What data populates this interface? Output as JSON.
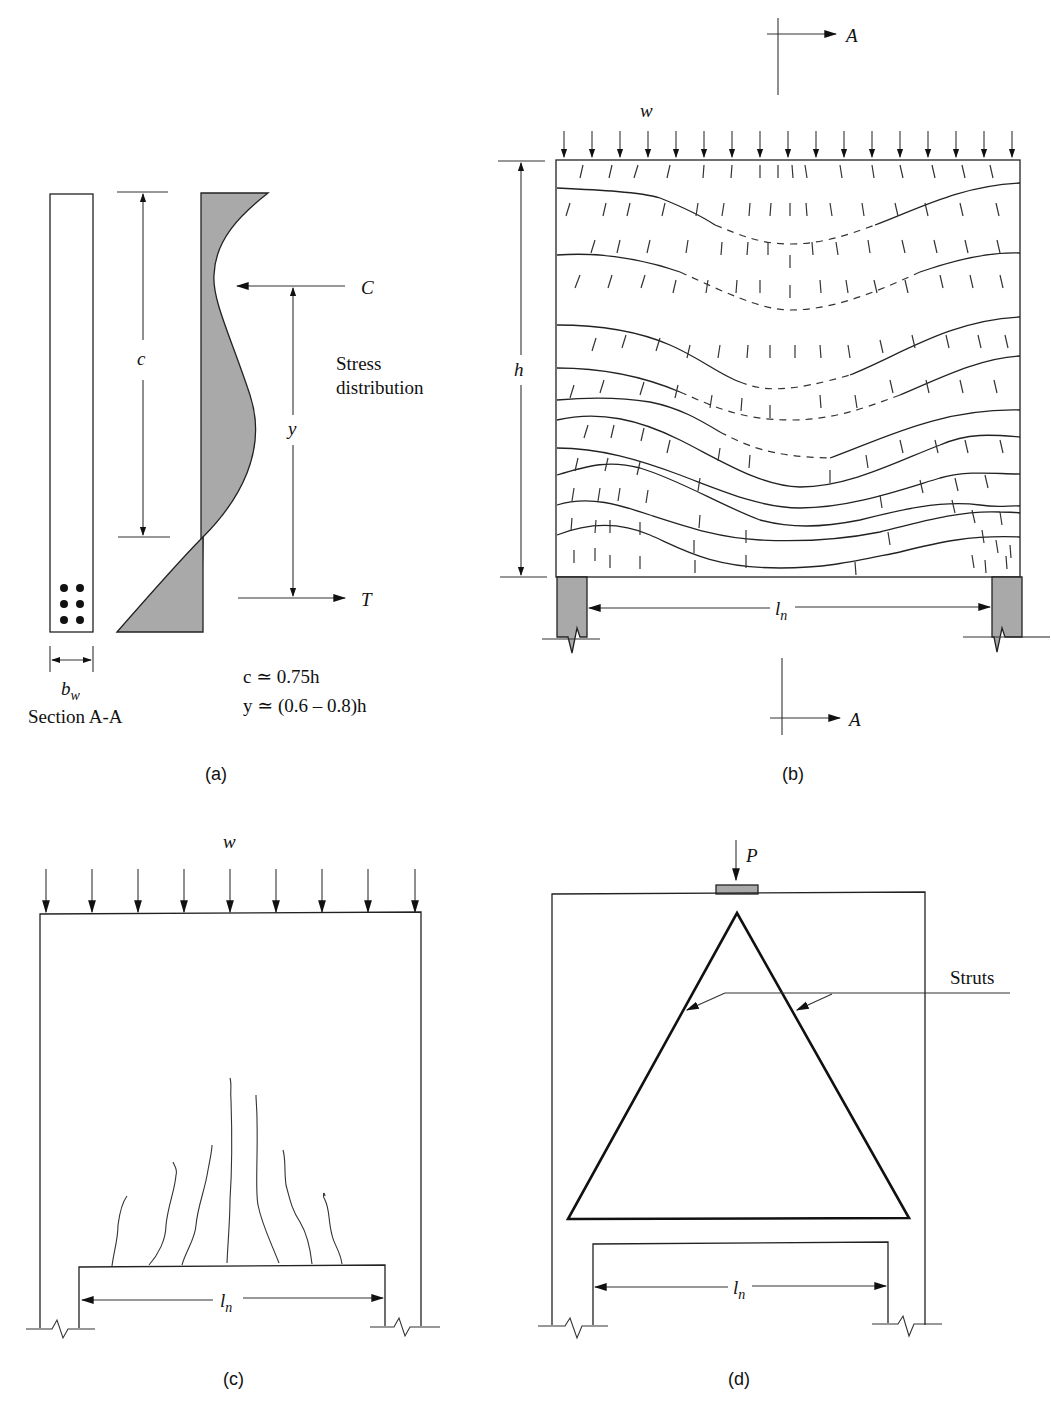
{
  "figure": {
    "panels": {
      "a": {
        "caption": "(a)",
        "section_label": "Section A-A",
        "dim_c": "c",
        "dim_y": "y",
        "dim_bw": "b",
        "dim_bw_sub": "w",
        "force_C": "C",
        "force_T": "T",
        "stress_label_line1": "Stress",
        "stress_label_line2": "distribution",
        "eq_c": "c ≃ 0.75h",
        "eq_y": "y ≃ (0.6 – 0.8)h",
        "rebar_count": 6
      },
      "b": {
        "caption": "(b)",
        "load": "w",
        "dim_h": "h",
        "dim_ln": "l",
        "dim_ln_sub": "n",
        "section_top": "A",
        "section_bottom": "A",
        "load_arrow_count": 17
      },
      "c": {
        "caption": "(c)",
        "load": "w",
        "dim_ln": "l",
        "dim_ln_sub": "n",
        "load_arrow_count": 9,
        "crack_count": 8
      },
      "d": {
        "caption": "(d)",
        "load": "P",
        "struts_label": "Struts",
        "dim_ln": "l",
        "dim_ln_sub": "n"
      }
    },
    "colors": {
      "line": "#222222",
      "shade": "#a9a9a9",
      "background": "#ffffff"
    }
  }
}
